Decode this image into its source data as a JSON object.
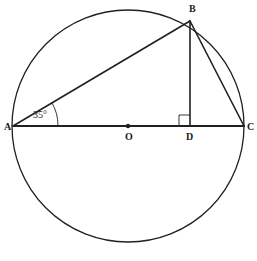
{
  "diagram": {
    "stroke_color": "#231f20",
    "fill_color": "#ffffff",
    "circle": {
      "name": "circumscribed-circle",
      "center_x": 128,
      "center_y": 126,
      "radius": 116
    },
    "points": [
      {
        "id": "A",
        "label": "A",
        "x": 13,
        "y": 126,
        "label_x": 4,
        "label_y": 122
      },
      {
        "id": "B",
        "label": "B",
        "x": 190,
        "y": 21,
        "label_x": 189,
        "label_y": 4
      },
      {
        "id": "C",
        "label": "C",
        "x": 244,
        "y": 126,
        "label_x": 247,
        "label_y": 122
      },
      {
        "id": "O",
        "label": "O",
        "x": 128,
        "y": 126,
        "label_x": 125,
        "label_y": 132
      },
      {
        "id": "D",
        "label": "D",
        "x": 190,
        "y": 126,
        "label_x": 186,
        "label_y": 132
      }
    ],
    "segments": [
      {
        "id": "AC",
        "from": "A",
        "to": "C",
        "x1": 13,
        "y1": 126,
        "x2": 244,
        "y2": 126
      },
      {
        "id": "AB",
        "from": "A",
        "to": "B",
        "x1": 13,
        "y1": 126,
        "x2": 190,
        "y2": 21
      },
      {
        "id": "BC",
        "from": "B",
        "to": "C",
        "x1": 190,
        "y1": 21,
        "x2": 244,
        "y2": 126
      },
      {
        "id": "BD",
        "from": "B",
        "to": "D",
        "x1": 190,
        "y1": 21,
        "x2": 190,
        "y2": 126
      }
    ],
    "center_dot": {
      "cx": 128,
      "cy": 126,
      "r": 2.2
    },
    "angle_arc": {
      "at": "A",
      "value": "35",
      "unit": "°",
      "label": "35°",
      "label_x": 33,
      "label_y": 110,
      "arc_radius": 45
    },
    "right_angle_marker": {
      "at": "D",
      "size": 11,
      "x": 179,
      "y": 115
    }
  }
}
